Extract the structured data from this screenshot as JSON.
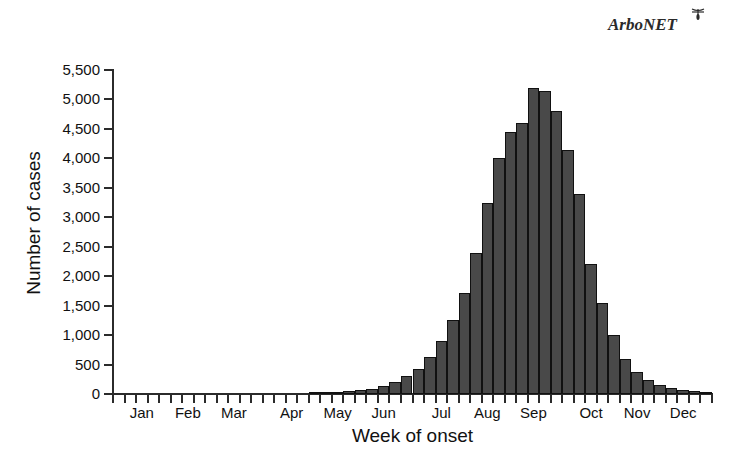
{
  "logo": {
    "text": "ArboNET",
    "icon": "mosquito-icon"
  },
  "chart_data": {
    "type": "bar",
    "title": "",
    "xlabel": "Week of onset",
    "ylabel": "Number of cases",
    "ylim": [
      0,
      5500
    ],
    "ytick_labels": [
      "0",
      "500",
      "1,000",
      "1,500",
      "2,000",
      "2,500",
      "3,000",
      "3,500",
      "4,000",
      "4,500",
      "5,000",
      "5,500"
    ],
    "ytick_values": [
      0,
      500,
      1000,
      1500,
      2000,
      2500,
      3000,
      3500,
      4000,
      4500,
      5000,
      5500
    ],
    "grid": false,
    "legend": "none",
    "bar_color": "#494949",
    "bar_edge_color": "#111111",
    "axis_color": "#2b2b2b",
    "month_labels": [
      "Jan",
      "Feb",
      "Mar",
      "Apr",
      "May",
      "Jun",
      "Jul",
      "Aug",
      "Sep",
      "Oct",
      "Nov",
      "Dec"
    ],
    "month_tick_index": [
      2,
      6,
      10,
      15,
      19,
      23,
      28,
      32,
      36,
      41,
      45,
      49
    ],
    "x_tick_count": 52,
    "categories": [
      1,
      2,
      3,
      4,
      5,
      6,
      7,
      8,
      9,
      10,
      11,
      12,
      13,
      14,
      15,
      16,
      17,
      18,
      19,
      20,
      21,
      22,
      23,
      24,
      25,
      26,
      27,
      28,
      29,
      30,
      31,
      32,
      33,
      34,
      35,
      36,
      37,
      38,
      39,
      40,
      41,
      42,
      43,
      44,
      45,
      46,
      47,
      48,
      49,
      50,
      51,
      52
    ],
    "values": [
      0,
      0,
      0,
      0,
      0,
      0,
      0,
      0,
      0,
      0,
      0,
      0,
      0,
      0,
      0,
      0,
      0,
      20,
      30,
      40,
      50,
      60,
      90,
      130,
      200,
      300,
      420,
      620,
      900,
      1250,
      1720,
      2400,
      3250,
      4000,
      4450,
      4600,
      5200,
      5150,
      4800,
      4150,
      3400,
      2200,
      1550,
      1000,
      600,
      370,
      230,
      150,
      100,
      70,
      50,
      30
    ]
  }
}
